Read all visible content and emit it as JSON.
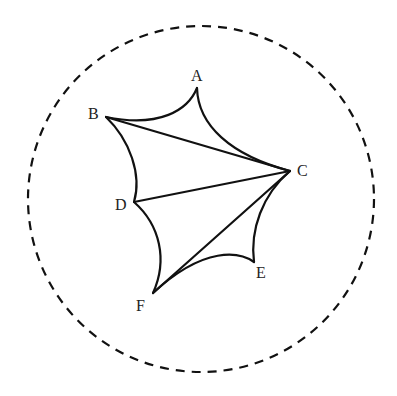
{
  "diagram": {
    "type": "geometry",
    "colors": {
      "stroke": "#111111",
      "label": "#222222",
      "background": "#ffffff"
    },
    "circle": {
      "cx": 201,
      "cy": 199,
      "r": 173,
      "style": "dashed"
    },
    "points": {
      "A": {
        "label": "A",
        "x": 197,
        "y": 88,
        "label_x": 191,
        "label_y": 81
      },
      "B": {
        "label": "B",
        "x": 106,
        "y": 117,
        "label_x": 88,
        "label_y": 119
      },
      "C": {
        "label": "C",
        "x": 290,
        "y": 171,
        "label_x": 297,
        "label_y": 176
      },
      "D": {
        "label": "D",
        "x": 134,
        "y": 202,
        "label_x": 115,
        "label_y": 210
      },
      "E": {
        "label": "E",
        "x": 254,
        "y": 262,
        "label_x": 256,
        "label_y": 278
      },
      "F": {
        "label": "F",
        "x": 153,
        "y": 293,
        "label_x": 136,
        "label_y": 311
      }
    },
    "curved_edges": [
      {
        "from": "A",
        "to": "B"
      },
      {
        "from": "A",
        "to": "C"
      },
      {
        "from": "B",
        "to": "D"
      },
      {
        "from": "C",
        "to": "E"
      },
      {
        "from": "D",
        "to": "F"
      },
      {
        "from": "E",
        "to": "F"
      }
    ],
    "straight_edges": [
      {
        "from": "B",
        "to": "C"
      },
      {
        "from": "D",
        "to": "C"
      },
      {
        "from": "F",
        "to": "C"
      }
    ]
  }
}
